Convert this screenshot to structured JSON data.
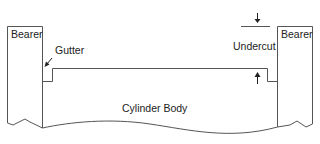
{
  "diagram": {
    "labels": {
      "left_bearer": "Bearer",
      "right_bearer": "Bearer",
      "gutter": "Gutter",
      "undercut": "Undercut",
      "body": "Cylinder Body"
    },
    "colors": {
      "stroke": "#555555",
      "text": "#222222",
      "background": "#ffffff"
    }
  }
}
